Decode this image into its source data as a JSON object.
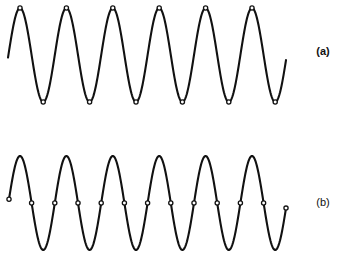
{
  "figure": {
    "panels": [
      {
        "id": "a",
        "label": "(a)",
        "label_bold": true,
        "label_pos": [
          323,
          55
        ],
        "wave": {
          "x_start": 8,
          "x_end": 286,
          "mid_y": 55,
          "amplitude": 47,
          "first_peak_x": 20,
          "period": 46.4
        },
        "sample_points": "peaks-and-troughs"
      },
      {
        "id": "b",
        "label": "(b)",
        "label_bold": false,
        "label_pos": [
          323,
          206
        ],
        "wave": {
          "x_start": 9,
          "x_end": 286,
          "mid_y": 203,
          "amplitude": 47,
          "first_peak_x": 20,
          "period": 46.4
        },
        "sample_points": "zero-crossings"
      }
    ],
    "colors": {
      "stroke": "#111111",
      "background": "#ffffff"
    }
  }
}
